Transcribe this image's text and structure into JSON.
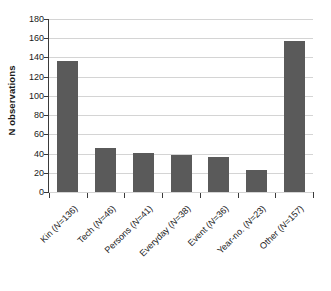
{
  "chart_data": {
    "type": "bar",
    "title": "",
    "subtitle": "",
    "xlabel": "",
    "ylabel": "N observations",
    "ylim": [
      0,
      180
    ],
    "ytick_step": 20,
    "yticks": [
      0,
      20,
      40,
      60,
      80,
      100,
      120,
      140,
      160,
      180
    ],
    "grid": "horizontal",
    "legend": "none",
    "bar_color": "#5a5a5a",
    "gridline_color": "#d4d4d4",
    "axis_color": "#3a3a3a",
    "background_color": "#ffffff",
    "categories": [
      "Kin (N=136)",
      "Tech (N=46)",
      "Persons (N=41)",
      "Everyday (N=38)",
      "Event (N=36)",
      "Year-no. (N=23)",
      "Other (N=157)"
    ],
    "category_names": [
      "Kin",
      "Tech",
      "Persons",
      "Everyday",
      "Event",
      "Year-no.",
      "Other"
    ],
    "category_counts": [
      136,
      46,
      41,
      38,
      36,
      23,
      157
    ],
    "values": [
      136,
      46,
      41,
      38,
      36,
      23,
      157
    ]
  }
}
